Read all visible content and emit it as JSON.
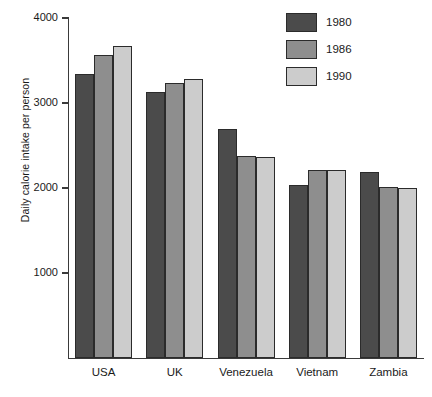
{
  "chart_data": {
    "type": "bar",
    "title": "",
    "xlabel": "",
    "ylabel": "Daily calorie intake per person",
    "categories": [
      "USA",
      "UK",
      "Venezuela",
      "Vietnam",
      "Zambia"
    ],
    "series": [
      {
        "name": "1980",
        "color": "#4b4b4b",
        "values": [
          3340,
          3130,
          2700,
          2030,
          2190
        ]
      },
      {
        "name": "1986",
        "color": "#8e8e8e",
        "values": [
          3560,
          3240,
          2380,
          2210,
          2010
        ]
      },
      {
        "name": "1990",
        "color": "#cccccc",
        "values": [
          3670,
          3280,
          2360,
          2210,
          2000
        ]
      }
    ],
    "ylim": [
      0,
      4000
    ],
    "yticks": [
      1000,
      2000,
      3000,
      4000
    ],
    "ytick_labels": [
      "1000",
      "2000",
      "3000",
      "4000"
    ],
    "grid": false,
    "legend_position": "top-right",
    "legend_entries": [
      "1980",
      "1986",
      "1990"
    ]
  }
}
